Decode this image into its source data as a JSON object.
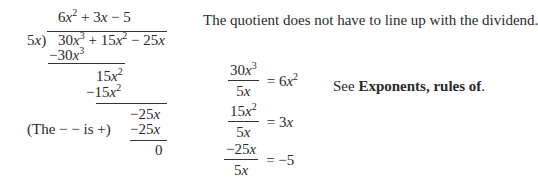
{
  "division": {
    "divisor": "5x)",
    "quotient": [
      "6x",
      "2",
      " + 3x − 5"
    ],
    "dividend": [
      "30x",
      "3",
      " + 15x",
      "2",
      " − 25x"
    ],
    "steps": {
      "sub1": [
        "−30x",
        "3"
      ],
      "rem1": [
        "15x",
        "2"
      ],
      "sub2": [
        "−15x",
        "2"
      ],
      "rem2": "−25x",
      "sub3": "−25x",
      "remainder": "0"
    },
    "note": "(The − − is +)"
  },
  "side_note": "The quotient does not have to line up with the dividend.",
  "fractions": [
    {
      "num": [
        "30x",
        "3"
      ],
      "den": "5x",
      "result": [
        "6x",
        "2"
      ]
    },
    {
      "num": [
        "15x",
        "2"
      ],
      "den": "5x",
      "result": [
        "3x",
        ""
      ]
    },
    {
      "num": [
        "−25x",
        ""
      ],
      "den": "5x",
      "result": [
        "−5",
        ""
      ]
    }
  ],
  "reference": {
    "prefix": "See ",
    "link": "Exponents, rules of",
    "suffix": "."
  }
}
